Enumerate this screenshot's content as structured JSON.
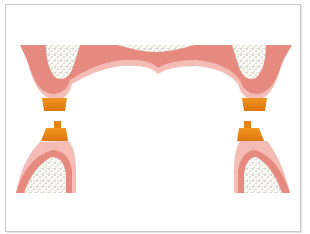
{
  "figure": {
    "colors": {
      "gum_outer": "#f2b8b0",
      "gum_main": "#e5877c",
      "gum_dark": "#d9766c",
      "bone": "#fbfaf4",
      "bone_speckle": "#8a8f88",
      "attachment": "#e07b14",
      "attachment_light": "#f0941f",
      "frame_border": "#c8c8c8"
    },
    "elements": {
      "upper_arch": {
        "label": ""
      },
      "lower_left_ridge": {
        "label": ""
      },
      "lower_right_ridge": {
        "label": ""
      },
      "attachment_upper_left": {
        "label": ""
      },
      "attachment_upper_right": {
        "label": ""
      },
      "attachment_lower_left": {
        "label": ""
      },
      "attachment_lower_right": {
        "label": ""
      }
    }
  }
}
